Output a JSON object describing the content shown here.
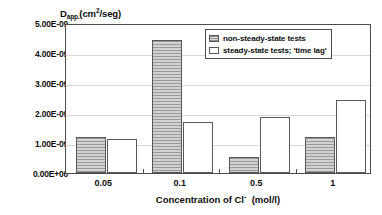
{
  "chart_data": {
    "type": "bar",
    "title": "",
    "subtitle": "",
    "xlabel_text": "Concentration of Cl",
    "xlabel_sup": "-",
    "xlabel_tail": "(mol/l)",
    "ylabel_main": "D",
    "ylabel_sub": "app.",
    "ylabel_unit_open": "(cm",
    "ylabel_unit_sup": "2",
    "ylabel_unit_close": "/seg)",
    "categories": [
      "0.05",
      "0.1",
      "0.5",
      "1"
    ],
    "series": [
      {
        "name": "non-steady-state tests",
        "color": "#bfbfbf",
        "pattern": "horizontal-lines",
        "values": [
          1.2e-09,
          4.45e-09,
          5.5e-10,
          1.2e-09
        ],
        "value_labels": [
          "1.20E-09",
          "4.45E-09",
          "5.50E-10",
          "1.20E-09"
        ]
      },
      {
        "name": "steady-state tests; 'time lag'",
        "color": "#ffffff",
        "pattern": "solid",
        "values": [
          1.12e-09,
          1.7e-09,
          1.88e-09,
          2.42e-09
        ],
        "value_labels": [
          "1.12E-09",
          "1.70E-09",
          "1.88E-09",
          "2.42E-09"
        ]
      }
    ],
    "ylim": [
      0,
      5e-09
    ],
    "yticks": [
      0,
      1e-09,
      2e-09,
      3e-09,
      4e-09,
      5e-09
    ],
    "ytick_labels": [
      "0.00E+00",
      "1.00E-09",
      "2.00E-09",
      "3.00E-09",
      "4.00E-09",
      "5.00E-09"
    ],
    "grid": true,
    "grid_axis": "y",
    "legend_position": "top-right",
    "legend_entries": [
      "non-steady-state tests",
      "steady-state tests; 'time lag'"
    ],
    "axis_color": "#4d4d4d",
    "grid_color": "#d8d8d8",
    "bar_border_color": "#58585a",
    "plot_background": "#ffffff"
  }
}
